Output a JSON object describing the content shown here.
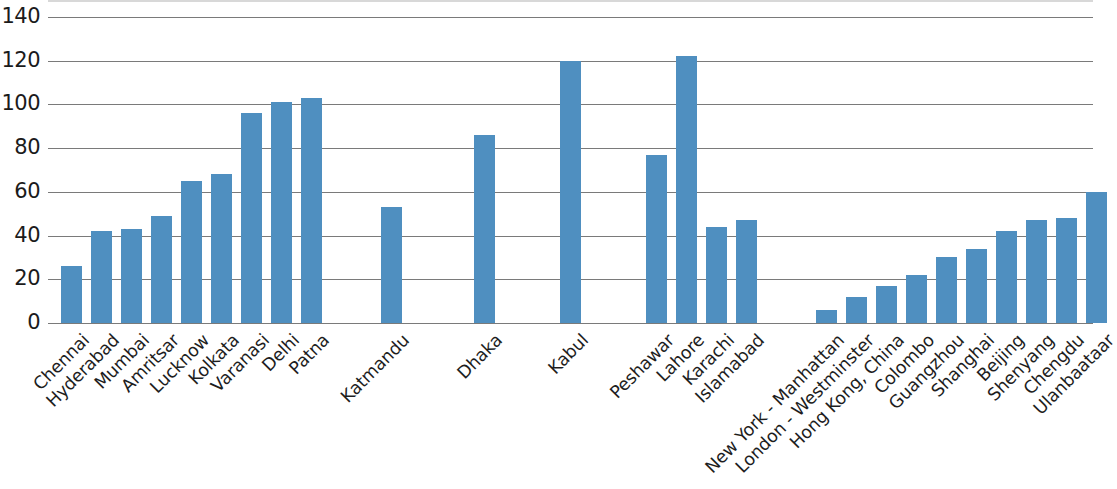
{
  "chart_data": {
    "type": "bar",
    "title": "",
    "subtitle": "",
    "xlabel": "",
    "ylabel": "",
    "ylim": [
      0,
      140
    ],
    "ytick_step": 20,
    "yticks": [
      140,
      120,
      100,
      80,
      60,
      40,
      20,
      0
    ],
    "ytick_labels": [
      "140",
      "120",
      "100",
      "80",
      "60",
      "40",
      "20",
      "0"
    ],
    "grid": true,
    "grid_axis": "y",
    "legend": false,
    "legend_position": "none",
    "bar_color": "#4f8fc0",
    "grid_color": "#7a7a7a",
    "axis_text_color": "#1b1b1b",
    "categories": [
      "Chennai",
      "Hyderabad",
      "Mumbai",
      "Amritsar",
      "Lucknow",
      "Kolkata",
      "Varanasi",
      "Delhi",
      "Patna",
      "Katmandu",
      "Dhaka",
      "Kabul",
      "Peshawar",
      "Lahore",
      "Karachi",
      "Islamabad",
      "New York - Manhattan",
      "London - Westminster",
      "Hong Kong, China",
      "Colombo",
      "Guangzhou",
      "Shanghai",
      "Beijing",
      "Shenyang",
      "Chengdu",
      "Ulanbaataar"
    ],
    "values": [
      26,
      42,
      43,
      49,
      65,
      68,
      96,
      101,
      103,
      53,
      86,
      120,
      77,
      122,
      44,
      47,
      6,
      12,
      17,
      22,
      30,
      34,
      42,
      47,
      48,
      60
    ],
    "groups": [
      {
        "name": "India",
        "start_index": 0,
        "count": 9
      },
      {
        "name": "Nepal / Bangladesh / Afghanistan",
        "start_index": 9,
        "count": 3
      },
      {
        "name": "Pakistan",
        "start_index": 12,
        "count": 4
      },
      {
        "name": "Other",
        "start_index": 16,
        "count": 10
      }
    ],
    "bar_x_positions": [
      13,
      43,
      73,
      103,
      133,
      163,
      193,
      223,
      253,
      333,
      426,
      512,
      598,
      628,
      658,
      688,
      768,
      798,
      828,
      858,
      888,
      918,
      948,
      978,
      1008,
      1038
    ]
  }
}
